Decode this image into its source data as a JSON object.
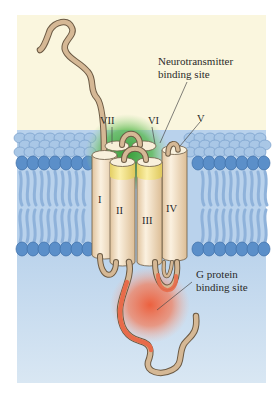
{
  "figure": {
    "helix_labels": [
      "I",
      "II",
      "III",
      "IV",
      "V",
      "VI",
      "VII"
    ],
    "callouts": {
      "neurotransmitter_line1": "Neurotransmitter",
      "neurotransmitter_line2": "binding site",
      "gprotein_line1": "G protein",
      "gprotein_line2": "binding site"
    },
    "colors": {
      "extracellular": "#faf6de",
      "cytoplasm": "#cfe1f0",
      "lipid_head": "#5b8fc9",
      "lipid_tail": "#9dbde0",
      "helix": "#f1ddbf",
      "helix_top": "#f7eed8",
      "helix_yellow": "#efe08a",
      "loop": "#d5b895",
      "binding_green": "#3aa83a",
      "binding_red": "#e8603f"
    }
  }
}
